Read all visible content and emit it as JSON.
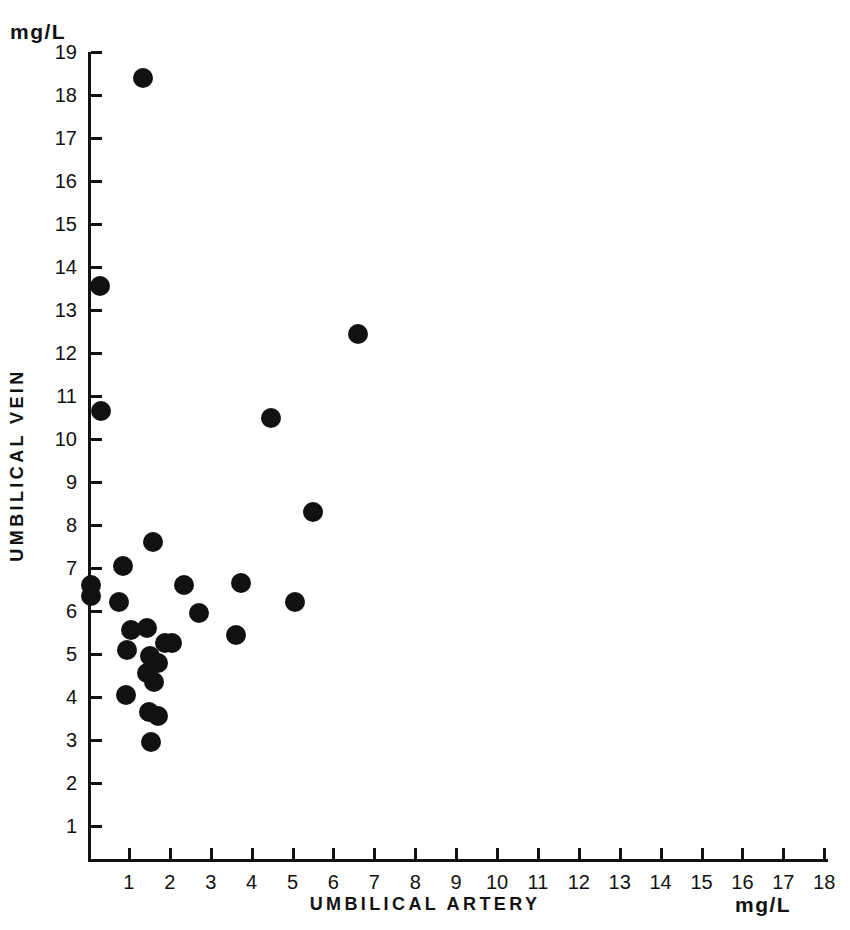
{
  "figure": {
    "unit_top_left": "mg/L",
    "unit_bottom_right": "mg/L",
    "x_axis_title": "UMBILICAL ARTERY",
    "y_axis_title": "UMBILICAL  VEIN"
  },
  "chart_data": {
    "type": "scatter",
    "title": "",
    "xlabel": "UMBILICAL ARTERY",
    "ylabel": "UMBILICAL VEIN",
    "x_unit": "mg/L",
    "y_unit": "mg/L",
    "xlim": [
      0,
      18
    ],
    "ylim": [
      0,
      19
    ],
    "grid": false,
    "legend": null,
    "marker": {
      "shape": "circle",
      "color": "#111111",
      "size_px": 20
    },
    "xticks": [
      1,
      2,
      3,
      4,
      5,
      6,
      7,
      8,
      9,
      10,
      11,
      12,
      13,
      14,
      15,
      16,
      17,
      18
    ],
    "yticks": [
      1,
      2,
      3,
      4,
      5,
      6,
      7,
      8,
      9,
      10,
      11,
      12,
      13,
      14,
      15,
      16,
      17,
      18,
      19
    ],
    "xtick_labels": [
      "1",
      "2",
      "3",
      "4",
      "5",
      "6",
      "7",
      "8",
      "9",
      "10",
      "11",
      "12",
      "13",
      "14",
      "15",
      "16",
      "17",
      "18"
    ],
    "ytick_labels": [
      "1",
      "2",
      "3",
      "4",
      "5",
      "6",
      "7",
      "8",
      "9",
      "10",
      "11",
      "12",
      "13",
      "14",
      "15",
      "16",
      "17",
      "18",
      "19"
    ],
    "n_points": 34,
    "points": [
      {
        "x": 1.35,
        "y": 18.4
      },
      {
        "x": 0.3,
        "y": 13.55
      },
      {
        "x": 6.6,
        "y": 12.45
      },
      {
        "x": 0.33,
        "y": 10.65
      },
      {
        "x": 4.47,
        "y": 10.5
      },
      {
        "x": 5.5,
        "y": 8.3
      },
      {
        "x": 1.6,
        "y": 7.6
      },
      {
        "x": 0.85,
        "y": 7.05
      },
      {
        "x": 0.08,
        "y": 6.6
      },
      {
        "x": 0.08,
        "y": 6.35
      },
      {
        "x": 2.35,
        "y": 6.6
      },
      {
        "x": 3.75,
        "y": 6.65
      },
      {
        "x": 0.75,
        "y": 6.2
      },
      {
        "x": 5.05,
        "y": 6.2
      },
      {
        "x": 2.72,
        "y": 5.95
      },
      {
        "x": 1.05,
        "y": 5.55
      },
      {
        "x": 1.45,
        "y": 5.6
      },
      {
        "x": 3.62,
        "y": 5.45
      },
      {
        "x": 0.95,
        "y": 5.1
      },
      {
        "x": 1.88,
        "y": 5.25
      },
      {
        "x": 2.05,
        "y": 5.25
      },
      {
        "x": 1.52,
        "y": 4.95
      },
      {
        "x": 1.7,
        "y": 4.8
      },
      {
        "x": 1.45,
        "y": 4.55
      },
      {
        "x": 1.62,
        "y": 4.35
      },
      {
        "x": 0.92,
        "y": 4.05
      },
      {
        "x": 1.5,
        "y": 3.65
      },
      {
        "x": 1.72,
        "y": 3.55
      },
      {
        "x": 1.55,
        "y": 2.95
      }
    ]
  }
}
